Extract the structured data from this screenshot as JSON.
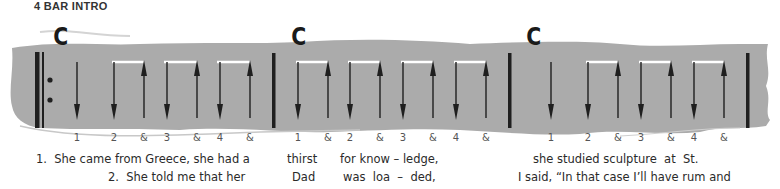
{
  "title": "4 BAR INTRO",
  "colors": {
    "band": "#ababab",
    "ink": "#1f1f1f",
    "tie": "#ffffff"
  },
  "bars": [
    {
      "chord": "C",
      "beats": [
        "1",
        "2",
        "&",
        "3",
        "&",
        "4",
        "&"
      ],
      "strokes": [
        "down",
        "down",
        "up",
        "down",
        "up",
        "down",
        "up"
      ]
    },
    {
      "chord": "C",
      "beats": [
        "1",
        "&",
        "2",
        "&",
        "3",
        "&",
        "4",
        "&"
      ],
      "strokes": [
        "down",
        "up",
        "down",
        "up",
        "down",
        "up",
        "down",
        "up"
      ]
    },
    {
      "chord": "C",
      "beats": [
        "1",
        "2",
        "&",
        "3",
        "&",
        "4",
        "&"
      ],
      "strokes": [
        "down",
        "down",
        "up",
        "down",
        "up",
        "down",
        "up"
      ]
    }
  ],
  "repeat_sign": "start-repeat",
  "lyrics": {
    "verse1": {
      "part1": "1.  She came from Greece, she had a",
      "part2": "thirst",
      "part3": "for know – ledge,",
      "part4": "she studied sculpture  at  St."
    },
    "verse2": {
      "part1": "2.  She told me that her",
      "part2": "Dad",
      "part3": "was  loa  –  ded,",
      "part4": "I said, “In that case I’ll have rum and"
    }
  }
}
